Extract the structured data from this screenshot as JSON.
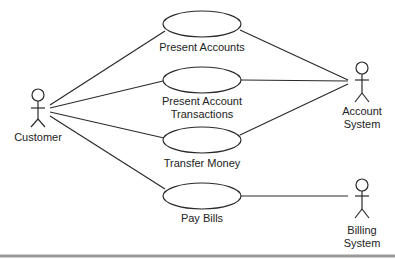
{
  "diagram": {
    "type": "uml-use-case",
    "actors": [
      {
        "id": "customer",
        "label_lines": [
          "Customer"
        ],
        "head": [
          38,
          95
        ]
      },
      {
        "id": "account-system",
        "label_lines": [
          "Account",
          "System"
        ],
        "head": [
          362,
          68
        ]
      },
      {
        "id": "billing-system",
        "label_lines": [
          "Billing",
          "System"
        ],
        "head": [
          362,
          185
        ]
      }
    ],
    "use_cases": [
      {
        "id": "present-accounts",
        "label_lines": [
          "Present Accounts"
        ],
        "center": [
          202,
          24
        ]
      },
      {
        "id": "present-account-transactions",
        "label_lines": [
          "Present Account",
          "Transactions"
        ],
        "center": [
          202,
          80
        ]
      },
      {
        "id": "transfer-money",
        "label_lines": [
          "Transfer Money"
        ],
        "center": [
          202,
          140
        ]
      },
      {
        "id": "pay-bills",
        "label_lines": [
          "Pay Bills"
        ],
        "center": [
          202,
          196
        ]
      }
    ],
    "associations": [
      {
        "from": "customer",
        "to": "present-accounts"
      },
      {
        "from": "customer",
        "to": "present-account-transactions"
      },
      {
        "from": "customer",
        "to": "transfer-money"
      },
      {
        "from": "customer",
        "to": "pay-bills"
      },
      {
        "from": "present-accounts",
        "to": "account-system"
      },
      {
        "from": "present-account-transactions",
        "to": "account-system"
      },
      {
        "from": "transfer-money",
        "to": "account-system"
      },
      {
        "from": "pay-bills",
        "to": "billing-system"
      }
    ],
    "colors": {
      "line": "#2a2a2a",
      "text": "#222222",
      "rule": "#9a9a9a",
      "background": "#ffffff"
    }
  }
}
